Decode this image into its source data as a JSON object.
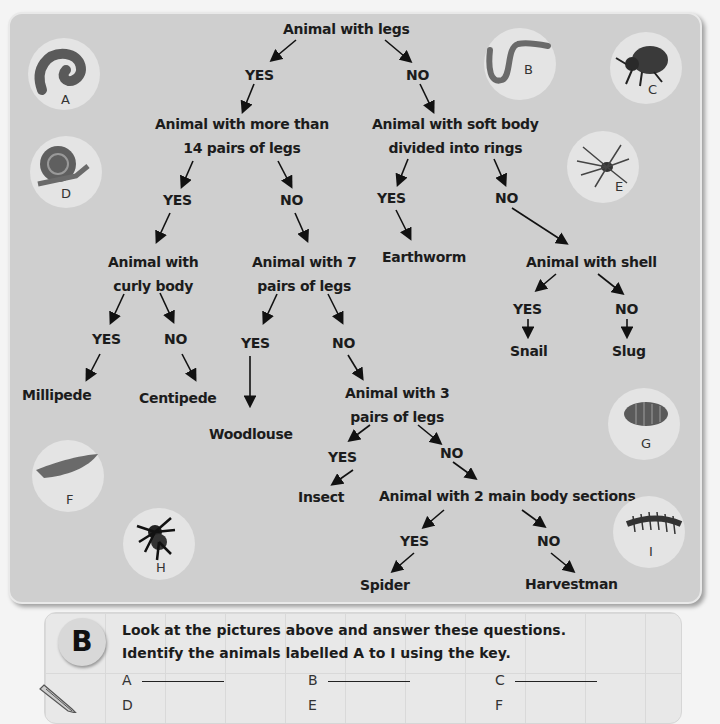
{
  "key": {
    "root": "Animal with legs",
    "yes": "YES",
    "no": "NO",
    "nodes": {
      "more_than_14": [
        "Animal with more than",
        "14 pairs of legs"
      ],
      "soft_body": [
        "Animal with soft body",
        "divided into rings"
      ],
      "curly_body": [
        "Animal with",
        "curly body"
      ],
      "seven_pairs": [
        "Animal with 7",
        "pairs of legs"
      ],
      "three_pairs": [
        "Animal with 3",
        "pairs of legs"
      ],
      "shell": "Animal with shell",
      "two_sections": "Animal with 2 main body sections"
    },
    "leaves": {
      "millipede": "Millipede",
      "centipede": "Centipede",
      "woodlouse": "Woodlouse",
      "earthworm": "Earthworm",
      "snail": "Snail",
      "slug": "Slug",
      "insect": "Insect",
      "spider": "Spider",
      "harvestman": "Harvestman"
    }
  },
  "pictures": [
    {
      "label": "A",
      "animal": "millipede-icon"
    },
    {
      "label": "B",
      "animal": "worm-icon"
    },
    {
      "label": "C",
      "animal": "beetle-icon"
    },
    {
      "label": "D",
      "animal": "snail-icon"
    },
    {
      "label": "E",
      "animal": "harvestman-icon"
    },
    {
      "label": "F",
      "animal": "slug-icon"
    },
    {
      "label": "G",
      "animal": "woodlouse-icon"
    },
    {
      "label": "H",
      "animal": "spider-icon"
    },
    {
      "label": "I",
      "animal": "centipede-icon"
    }
  ],
  "questions": {
    "section": "B",
    "line1": "Look at the pictures above and answer these questions.",
    "line2": "Identify the animals labelled A to I using the key.",
    "answers": [
      "A",
      "B",
      "C",
      "D",
      "E",
      "F"
    ]
  },
  "colors": {
    "panel": "#cfcfcf",
    "circle": "#e4e4e4",
    "text": "#1c1c1c"
  }
}
